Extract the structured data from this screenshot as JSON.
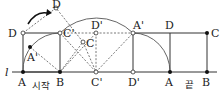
{
  "line_label": "l",
  "start_label": "시작",
  "end_label": "끝",
  "points": {
    "start_A": "A",
    "start_B": "B",
    "start_C": "C",
    "start_D": "D",
    "rot_D": "D",
    "rot_C": "C",
    "rot_A": "A'",
    "Cp_top": "C'",
    "Cp_bottom": "C'",
    "Dp_top": "D'",
    "Dp_bottom": "D'",
    "Ap_top": "A'",
    "end_D": "D",
    "end_A": "A",
    "end_C": "C",
    "end_B": "B"
  },
  "colors": {
    "stroke": "#333333",
    "dash": "#555555",
    "filled_point": "#111111",
    "open_point": "#ffffff"
  }
}
